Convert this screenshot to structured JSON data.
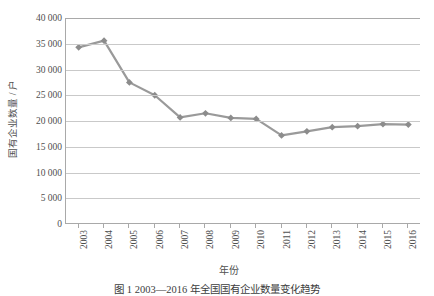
{
  "chart_data": {
    "type": "line",
    "title": "",
    "xlabel": "年份",
    "ylabel": "国有企业数量 / 户",
    "categories": [
      "2003",
      "2004",
      "2005",
      "2006",
      "2007",
      "2008",
      "2009",
      "2010",
      "2011",
      "2012",
      "2013",
      "2014",
      "2015",
      "2016"
    ],
    "values": [
      34300,
      35600,
      27500,
      25000,
      20700,
      21500,
      20600,
      20400,
      17200,
      18000,
      18800,
      19000,
      19400,
      19300
    ],
    "series": [
      {
        "name": "国有企业数量",
        "values": [
          34300,
          35600,
          27500,
          25000,
          20700,
          21500,
          20600,
          20400,
          17200,
          18000,
          18800,
          19000,
          19400,
          19300
        ]
      }
    ],
    "ylim": [
      0,
      40000
    ],
    "ytick_step": 5000,
    "ytick_labels": [
      "40 000",
      "35 000",
      "30 000",
      "25 000",
      "20 000",
      "15 000",
      "10 000",
      "5 000",
      "0"
    ],
    "ytick_values": [
      40000,
      35000,
      30000,
      25000,
      20000,
      15000,
      10000,
      5000,
      0
    ],
    "grid": true,
    "legend": false,
    "legend_position": "none",
    "marker": "diamond",
    "line_color": "#9a9a9a",
    "marker_color": "#8c8c8c",
    "grid_color": "#c9c9c9",
    "axis_color": "#a9a9a9"
  },
  "caption": {
    "text": "图 1  2003—2016 年全国国有企业数量变化趋势"
  }
}
